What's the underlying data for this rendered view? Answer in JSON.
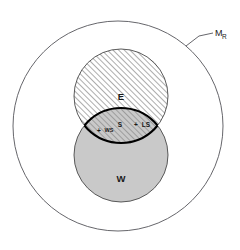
{
  "diagram": {
    "type": "euler-venn",
    "title_visible": false,
    "background_color": "#ffffff",
    "universe": {
      "label": "M",
      "label_subscript": "R",
      "fill_color": "#ffffff",
      "stroke_color": "#55555a",
      "cx": 118,
      "cy": 126,
      "r": 105,
      "leader_line": true
    },
    "sets": [
      {
        "id": "E",
        "label": "E",
        "fill_style": "hatched",
        "fill_color": "#ffffff",
        "hatch_color": "#8a8a8a",
        "stroke_color": "#4a4a4a",
        "cx": 121,
        "cy": 96,
        "r": 47,
        "label_x": 121,
        "label_y": 96
      },
      {
        "id": "W",
        "label": "W",
        "fill_style": "solid",
        "fill_color": "#c9c9c9",
        "stroke_color": "#4a4a4a",
        "cx": 121,
        "cy": 155,
        "r": 47,
        "label_x": 121,
        "label_y": 178
      }
    ],
    "intersection": {
      "stroke_color": "#000000",
      "stroke_width": 2.2,
      "fill_color": "#c9c9c9",
      "hatched": true
    },
    "points": [
      {
        "id": "WS",
        "label": "WS",
        "marker": "+",
        "x": 104,
        "y": 130,
        "has_marker": true
      },
      {
        "id": "S",
        "label": "S",
        "marker": "",
        "x": 120,
        "y": 124,
        "has_marker": false
      },
      {
        "id": "LS",
        "label": "LS",
        "marker": "+",
        "x": 141,
        "y": 124,
        "has_marker": true
      }
    ]
  }
}
